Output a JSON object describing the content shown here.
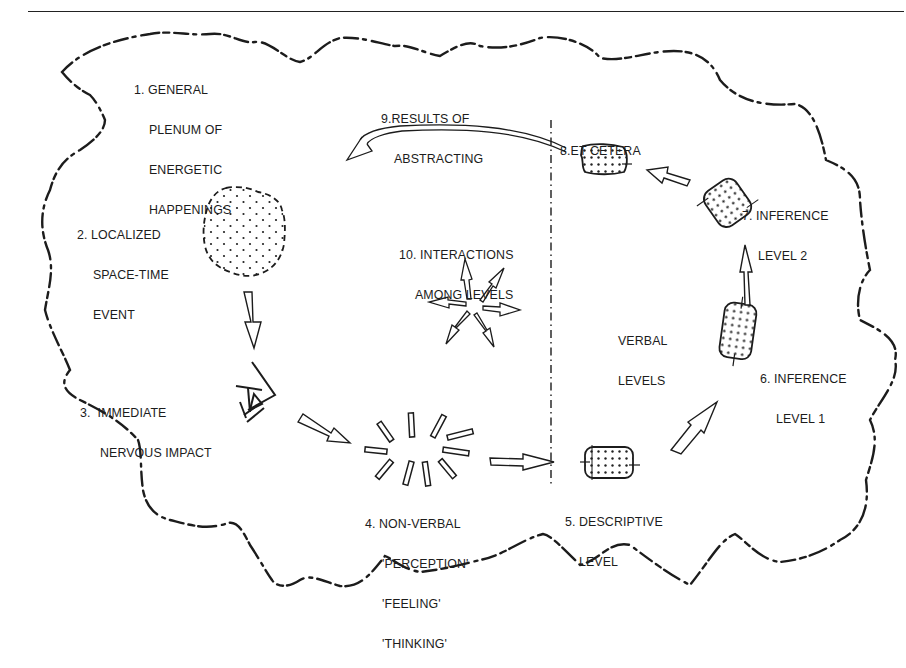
{
  "diagram": {
    "title": "",
    "labels": {
      "item1": {
        "lines": [
          "1. GENERAL",
          "PLENUM OF",
          "ENERGETIC",
          "HAPPENINGS"
        ]
      },
      "item2": {
        "lines": [
          "2. LOCALIZED",
          "SPACE-TIME",
          "EVENT"
        ]
      },
      "item3": {
        "lines": [
          "3.  IMMEDIATE",
          "NERVOUS IMPACT"
        ]
      },
      "item4": {
        "lines": [
          "4. NON-VERBAL",
          "'PERCEPTION'",
          "'FEELING'",
          "'THINKING'"
        ]
      },
      "item5": {
        "lines": [
          "5. DESCRIPTIVE",
          "LEVEL"
        ]
      },
      "item6": {
        "lines": [
          "6. INFERENCE",
          "LEVEL 1"
        ]
      },
      "item7": {
        "lines": [
          "7. INFERENCE",
          "LEVEL 2"
        ]
      },
      "item8": {
        "lines": [
          "8.ET CETERA"
        ]
      },
      "item9": {
        "lines": [
          "9.RESULTS OF",
          "ABSTRACTING"
        ]
      },
      "item10": {
        "lines": [
          "10. INTERACTIONS",
          "AMONG LEVELS"
        ]
      },
      "verbal": {
        "lines": [
          "VERBAL",
          "LEVELS"
        ]
      }
    },
    "nodes": [
      {
        "id": 1,
        "name": "general-plenum",
        "shape": "dashed-cloud-boundary"
      },
      {
        "id": 2,
        "name": "localized-event",
        "shape": "dotted-blob"
      },
      {
        "id": 3,
        "name": "nervous-impact",
        "shape": "eye"
      },
      {
        "id": 4,
        "name": "non-verbal",
        "shape": "radiating-bars"
      },
      {
        "id": 5,
        "name": "descriptive-level",
        "shape": "dotted-tag"
      },
      {
        "id": 6,
        "name": "inference-level-1",
        "shape": "dotted-tag"
      },
      {
        "id": 7,
        "name": "inference-level-2",
        "shape": "dotted-tag"
      },
      {
        "id": 8,
        "name": "et-cetera",
        "shape": "dotted-tag"
      }
    ],
    "edges": [
      {
        "from": 2,
        "to": 3
      },
      {
        "from": 3,
        "to": 4
      },
      {
        "from": 4,
        "to": 5
      },
      {
        "from": 5,
        "to": 6
      },
      {
        "from": 6,
        "to": 7
      },
      {
        "from": 7,
        "to": 8
      },
      {
        "from": 8,
        "to": 1,
        "label": "9.RESULTS OF ABSTRACTING"
      }
    ],
    "divider": {
      "style": "dash-dot vertical",
      "separates": "non-verbal | verbal levels"
    },
    "colors": {
      "ink": "#1c1c1c",
      "background": "#ffffff"
    }
  }
}
